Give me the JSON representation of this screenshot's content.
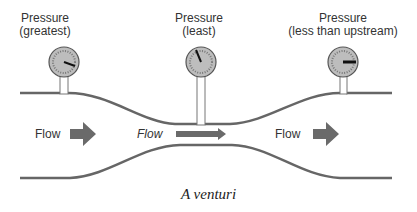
{
  "diagram": {
    "caption": "A venturi",
    "gauges": [
      {
        "title": "Pressure",
        "subtitle": "(greatest)",
        "needle_angle": 20
      },
      {
        "title": "Pressure",
        "subtitle": "(least)",
        "needle_angle": -120
      },
      {
        "title": "Pressure",
        "subtitle": "(less than upstream)",
        "needle_angle": 0
      }
    ],
    "flow_labels": [
      {
        "text": "Flow",
        "style": "normal"
      },
      {
        "text": "Flow",
        "style": "italic"
      },
      {
        "text": "Flow",
        "style": "normal"
      }
    ],
    "colors": {
      "pipe": "#666666",
      "arrow": "#6a6a6a",
      "gauge_face": "#bdbdbd",
      "text": "#333333"
    }
  }
}
